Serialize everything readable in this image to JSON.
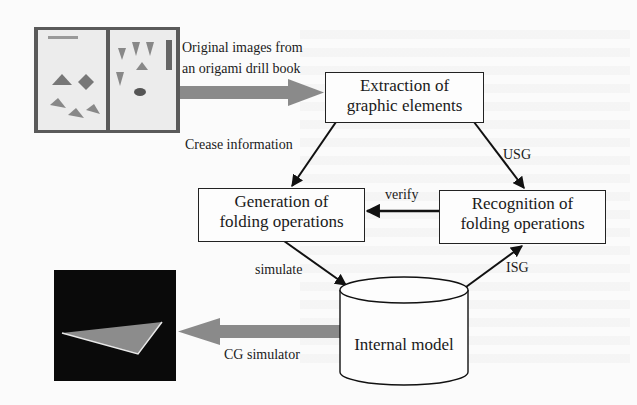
{
  "diagram": {
    "nodes": {
      "source_image": {
        "label": "Original images from an origami drill book",
        "line1": "Original images from",
        "line2": "an origami drill book"
      },
      "extraction": {
        "line1": "Extraction of",
        "line2": "graphic elements"
      },
      "generation": {
        "line1": "Generation of",
        "line2": "folding operations"
      },
      "recognition": {
        "line1": "Recognition of",
        "line2": "folding operations"
      },
      "internal_model": {
        "label": "Internal model"
      },
      "cg_output": {
        "label": "CG simulator"
      }
    },
    "edges": [
      {
        "from": "source_image",
        "to": "extraction",
        "label": "Original images from an origami drill book"
      },
      {
        "from": "extraction",
        "to": "generation",
        "label": "Crease information"
      },
      {
        "from": "extraction",
        "to": "recognition",
        "label": "USG"
      },
      {
        "from": "recognition",
        "to": "generation",
        "label": "verify"
      },
      {
        "from": "generation",
        "to": "internal_model",
        "label": "simulate"
      },
      {
        "from": "internal_model",
        "to": "recognition",
        "label": "ISG"
      },
      {
        "from": "internal_model",
        "to": "cg_output",
        "label": "CG simulator"
      }
    ],
    "edge_labels": {
      "crease": "Crease information",
      "usg": "USG",
      "verify": "verify",
      "simulate": "simulate",
      "isg": "ISG",
      "cg": "CG simulator"
    },
    "colors": {
      "thick_arrow": "#8a8a8a",
      "line": "#111111",
      "screen_bg": "#0a0a0a",
      "triangle": "#8c8c8c"
    }
  }
}
